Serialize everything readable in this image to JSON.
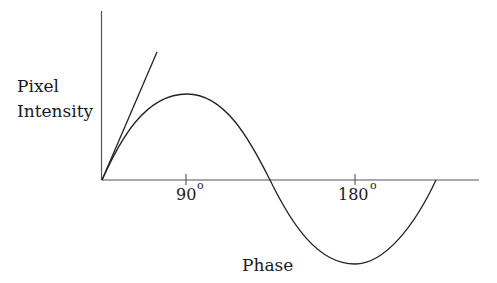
{
  "diagram": {
    "y_axis_label_line1": "Pixel",
    "y_axis_label_line2": "Intensity",
    "x_axis_label": "Phase",
    "ticks": [
      {
        "label": "90",
        "unit": "o"
      },
      {
        "label": "180",
        "unit": "o"
      }
    ],
    "elements": [
      {
        "type": "sine-curve",
        "description": "one full period starting at origin: rises to peak near 90°, crosses axis, trough at 180° tick, returns to axis"
      },
      {
        "type": "tangent-line",
        "description": "straight line from origin tangent to curve at start"
      }
    ]
  }
}
